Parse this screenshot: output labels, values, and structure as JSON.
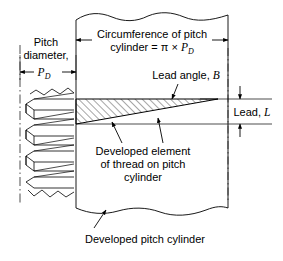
{
  "figure": {
    "background_color": "#ffffff",
    "line_color": "#000000",
    "hatch_color": "#000000"
  },
  "labels": {
    "circumference_line1": "Circumference of pitch",
    "circumference_line2_pre": "cylinder = ",
    "circumference_pi": "π",
    "circumference_times": " × ",
    "circumference_pd": "P",
    "circumference_pd_sub": "D",
    "pitch_line1": "Pitch",
    "pitch_line2": "diameter,",
    "pitch_symbol": "P",
    "pitch_symbol_sub": "D",
    "lead_angle_text": "Lead angle, ",
    "lead_angle_symbol": "B",
    "lead_text": "Lead, ",
    "lead_symbol": "L",
    "developed_element_line1": "Developed element",
    "developed_element_line2": "of thread on pitch",
    "developed_element_line3": "cylinder",
    "developed_cylinder": "Developed pitch cylinder"
  },
  "geometry": {
    "left_centerline_x": 20,
    "cylinder_left_x": 76,
    "cylinder_right_x": 228,
    "wedge_top_y": 99,
    "wedge_bottom_y": 124,
    "wedge_tip_x": 218,
    "break_top_y": 18,
    "break_bottom_y": 210,
    "pd_dimension_y": 72,
    "circumference_dimension_y": 40
  }
}
